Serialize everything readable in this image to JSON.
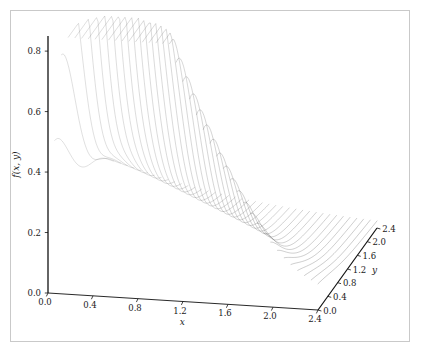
{
  "figure": {
    "background_color": "#ffffff",
    "frame_color": "#c9c9c9",
    "mesh_color": "#555555",
    "axis_color": "#111111"
  },
  "chart_data": {
    "type": "surface",
    "title": "",
    "subtitle": "",
    "projection": "3d-mesh-wireframe",
    "xlabel": "x",
    "ylabel": "y",
    "zlabel": "f(x, y)",
    "xlim": [
      0.0,
      2.4
    ],
    "ylim": [
      0.0,
      2.4
    ],
    "zlim": [
      0.0,
      0.85
    ],
    "grid": false,
    "legend": "none",
    "x_ticks": [
      "0.0",
      "0.4",
      "0.8",
      "1.2",
      "1.6",
      "2.0",
      "2.4"
    ],
    "y_ticks": [
      "0.0",
      "0.4",
      "0.8",
      "1.2",
      "1.6",
      "2.0",
      "2.4"
    ],
    "z_ticks": [
      "0.0",
      "0.2",
      "0.4",
      "0.6",
      "0.8"
    ],
    "x_tick_values": [
      0.0,
      0.4,
      0.8,
      1.2,
      1.6,
      2.0,
      2.4
    ],
    "y_tick_values": [
      0.0,
      0.4,
      0.8,
      1.2,
      1.6,
      2.0,
      2.4
    ],
    "z_tick_values": [
      0.0,
      0.2,
      0.4,
      0.6,
      0.8
    ],
    "mesh_resolution": {
      "nx": 41,
      "ny": 41
    },
    "surface_description": "Bivariate density-like surface: sharp ridge rising to a peak of about 0.80 near x=0.2 along the y=0 edge, decaying monotonically in x, with a secondary fold/valley crease running diagonally across the mid-domain near x=1.2, y=0.6; surface approaches ~0.0 at x=0 and flattens toward ~0.05 at large x and y.",
    "peak": {
      "x": 0.2,
      "y": 0.0,
      "z": 0.8
    },
    "notable_features": [
      {
        "name": "primary-peak",
        "x": 0.2,
        "y": 0.0,
        "z": 0.8
      },
      {
        "name": "diagonal-crease",
        "x": 1.2,
        "y": 0.6,
        "z": 0.26
      },
      {
        "name": "flat-tail",
        "x": 2.4,
        "y": 2.4,
        "z": 0.04
      }
    ]
  },
  "axes": {
    "z": {
      "label": "f(x, y)",
      "ticks": [
        "0.0",
        "0.2",
        "0.4",
        "0.6",
        "0.8"
      ]
    },
    "x": {
      "label": "x",
      "ticks": [
        "0.0",
        "0.4",
        "0.8",
        "1.2",
        "1.6",
        "2.0",
        "2.4"
      ]
    },
    "y": {
      "label": "y",
      "ticks": [
        "0.0",
        "0.4",
        "0.8",
        "1.2",
        "1.6",
        "2.0",
        "2.4"
      ]
    }
  }
}
